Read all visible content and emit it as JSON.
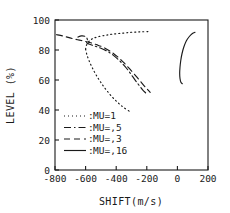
{
  "chart_data": {
    "type": "line",
    "title": "",
    "xlabel": "SHIFT(m/s)",
    "ylabel": "LEVEL (%)",
    "xlim": [
      -900,
      250
    ],
    "ylim": [
      0,
      100
    ],
    "xticks": [
      -800,
      -600,
      -400,
      -200,
      0,
      200
    ],
    "xticklabels": [
      "-800",
      "-600",
      "-400",
      "-200",
      "0",
      "200"
    ],
    "yticks": [
      0,
      20,
      40,
      60,
      80,
      100
    ],
    "yticklabels": [
      "0",
      "20",
      "40",
      "60",
      "80",
      "100"
    ],
    "grid": false,
    "legend_position": "lower-left-inside",
    "frame": "box",
    "series": [
      {
        "name": "MU=1",
        "style": "dotted",
        "dasharray": "1,3",
        "points": [
          [
            -600,
            80.5
          ],
          [
            -595,
            83.0
          ],
          [
            -580,
            85.5
          ],
          [
            -555,
            87.5
          ],
          [
            -520,
            88.8
          ],
          [
            -470,
            89.8
          ],
          [
            -420,
            90.6
          ],
          [
            -360,
            91.2
          ],
          [
            -300,
            91.8
          ],
          [
            -240,
            92.1
          ],
          [
            -190,
            92.3
          ],
          [
            -600,
            80.5
          ],
          [
            -592,
            77.0
          ],
          [
            -578,
            73.0
          ],
          [
            -558,
            68.5
          ],
          [
            -532,
            63.5
          ],
          [
            -498,
            58.0
          ],
          [
            -458,
            52.5
          ],
          [
            -412,
            47.2
          ],
          [
            -362,
            42.5
          ],
          [
            -312,
            39.0
          ]
        ]
      },
      {
        "name": "MU=,5",
        "style": "dashdot",
        "dasharray": "7,3,1.5,3",
        "points": [
          [
            -650,
            88.6
          ],
          [
            -628,
            89.4
          ],
          [
            -606,
            89.2
          ],
          [
            -592,
            88.0
          ],
          [
            -588,
            86.2
          ],
          [
            -594,
            84.8
          ],
          [
            -578,
            84.0
          ],
          [
            -545,
            82.8
          ],
          [
            -500,
            81.2
          ],
          [
            -452,
            78.8
          ],
          [
            -408,
            75.6
          ],
          [
            -368,
            71.8
          ],
          [
            -330,
            67.5
          ],
          [
            -296,
            62.8
          ],
          [
            -262,
            58.0
          ],
          [
            -230,
            53.8
          ],
          [
            -205,
            51.2
          ]
        ]
      },
      {
        "name": "MU=,3",
        "style": "dashed",
        "dasharray": "6,4",
        "points": [
          [
            -790,
            90.2
          ],
          [
            -752,
            89.4
          ],
          [
            -714,
            88.4
          ],
          [
            -676,
            87.4
          ],
          [
            -640,
            86.6
          ],
          [
            -604,
            85.8
          ],
          [
            -566,
            84.8
          ],
          [
            -524,
            83.4
          ],
          [
            -480,
            81.6
          ],
          [
            -436,
            79.0
          ],
          [
            -392,
            75.6
          ],
          [
            -350,
            71.6
          ],
          [
            -310,
            67.2
          ],
          [
            -272,
            62.8
          ],
          [
            -236,
            58.4
          ],
          [
            -204,
            54.6
          ],
          [
            -178,
            51.8
          ]
        ]
      },
      {
        "name": "MU=,16",
        "style": "solid",
        "dasharray": "none",
        "points": [
          [
            115,
            91.8
          ],
          [
            98,
            91.0
          ],
          [
            78,
            89.0
          ],
          [
            58,
            86.0
          ],
          [
            42,
            82.0
          ],
          [
            30,
            77.5
          ],
          [
            22,
            73.0
          ],
          [
            17,
            68.5
          ],
          [
            15,
            64.5
          ],
          [
            17,
            61.0
          ],
          [
            23,
            58.5
          ],
          [
            32,
            57.5
          ]
        ]
      }
    ],
    "legend": [
      {
        "label": "MU=1",
        "separator": ":",
        "style": "dotted"
      },
      {
        "label": "MU=,5",
        "separator": ":",
        "style": "dashdot"
      },
      {
        "label": "MU=,3",
        "separator": ":",
        "style": "dashed"
      },
      {
        "label": "MU=,16",
        "separator": ":",
        "style": "solid"
      }
    ],
    "colors": {
      "ink": "#1a1a1a",
      "background": "#ffffff"
    }
  }
}
